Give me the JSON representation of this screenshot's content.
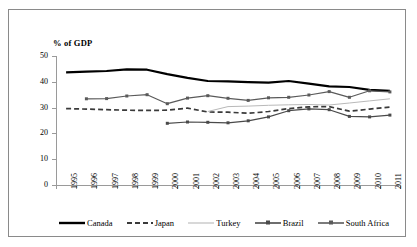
{
  "axis_title": "% of GDP",
  "chart_data": {
    "type": "line",
    "title": "",
    "xlabel": "",
    "ylabel": "% of GDP",
    "ylim": [
      0,
      50
    ],
    "yticks": [
      0,
      10,
      20,
      30,
      40,
      50
    ],
    "grid": false,
    "legend_position": "bottom",
    "categories": [
      "1995",
      "1996",
      "1997",
      "1998",
      "1999",
      "2000",
      "2001",
      "2002",
      "2003",
      "2004",
      "2005",
      "2006",
      "2007",
      "2008",
      "2009",
      "2010",
      "2011"
    ],
    "series": [
      {
        "name": "Canada",
        "color": "#000000",
        "style": "solid-thick",
        "values": [
          43.7,
          43.9,
          44.2,
          44.8,
          44.7,
          43.0,
          41.5,
          40.3,
          40.2,
          39.9,
          39.7,
          40.3,
          39.3,
          38.2,
          38.0,
          36.9,
          36.5
        ]
      },
      {
        "name": "Japan",
        "color": "#3a3a3a",
        "style": "dashed",
        "values": [
          29.6,
          29.4,
          29.2,
          29.0,
          28.9,
          29.0,
          29.8,
          28.3,
          28.2,
          27.8,
          28.5,
          29.6,
          30.3,
          30.4,
          28.6,
          29.4,
          30.2
        ]
      },
      {
        "name": "Turkey",
        "color": "#b9b9b9",
        "style": "solid-thin",
        "values": [
          null,
          null,
          null,
          null,
          null,
          null,
          null,
          28.5,
          30.4,
          30.6,
          30.9,
          31.1,
          31.2,
          31.0,
          31.8,
          32.6,
          33.4
        ]
      },
      {
        "name": "Brazil",
        "color": "#4a4a4a",
        "style": "marker",
        "values": [
          null,
          null,
          null,
          null,
          null,
          23.9,
          24.4,
          24.3,
          24.1,
          24.9,
          26.4,
          28.8,
          29.5,
          29.2,
          26.6,
          26.4,
          27.1
        ]
      },
      {
        "name": "South Africa",
        "color": "#5a5a5a",
        "style": "marker",
        "values": [
          null,
          33.4,
          33.5,
          34.5,
          35.0,
          31.5,
          33.7,
          34.6,
          33.6,
          32.8,
          33.8,
          34.0,
          34.9,
          36.2,
          34.0,
          36.5,
          36.1
        ]
      }
    ]
  },
  "legend": [
    {
      "label": "Canada"
    },
    {
      "label": "Japan"
    },
    {
      "label": "Turkey"
    },
    {
      "label": "Brazil"
    },
    {
      "label": "South Africa"
    }
  ]
}
